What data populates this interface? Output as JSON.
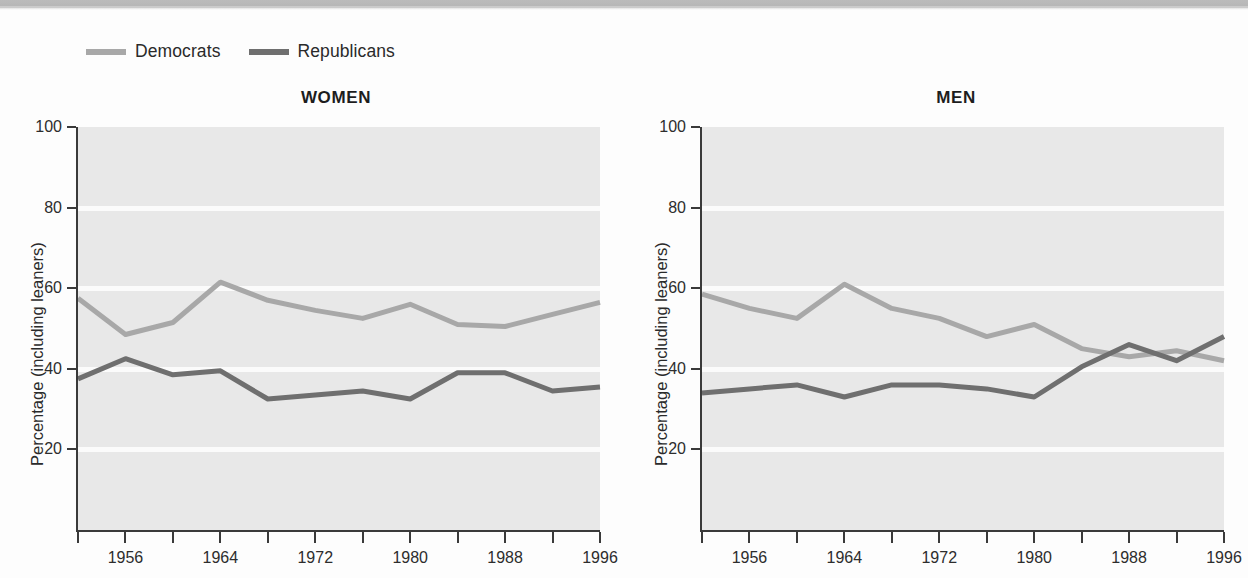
{
  "legend": {
    "entries": [
      {
        "label": "Democrats",
        "color": "#a8a8a8",
        "icon": "line-swatch-icon"
      },
      {
        "label": "Republicans",
        "color": "#6f6f6f",
        "icon": "line-swatch-icon"
      }
    ]
  },
  "panels": {
    "women": {
      "title": "WOMEN"
    },
    "men": {
      "title": "MEN"
    }
  },
  "axis": {
    "ylabel": "Percentage (including leaners)",
    "yticks": [
      "20",
      "40",
      "60",
      "80",
      "100"
    ],
    "xticks_labeled": [
      "1956",
      "1964",
      "1972",
      "1980",
      "1988",
      "1996"
    ]
  },
  "chart_data": [
    {
      "type": "line",
      "title": "WOMEN",
      "xlabel": "",
      "ylabel": "Percentage (including leaners)",
      "xlim": [
        1952,
        1996
      ],
      "ylim": [
        0,
        100
      ],
      "ytick_values": [
        20,
        40,
        60,
        80,
        100
      ],
      "grid": true,
      "legend_position": "above-top-left",
      "x": [
        1952,
        1956,
        1960,
        1964,
        1968,
        1972,
        1976,
        1980,
        1984,
        1988,
        1992,
        1996
      ],
      "series": [
        {
          "name": "Democrats",
          "color": "#a8a8a8",
          "values": [
            57.5,
            48.5,
            51.5,
            61.5,
            57,
            54.5,
            52.5,
            56,
            51,
            50.5,
            53.5,
            56.5
          ]
        },
        {
          "name": "Republicans",
          "color": "#6f6f6f",
          "values": [
            37.5,
            42.5,
            38.5,
            39.5,
            32.5,
            33.5,
            34.5,
            32.5,
            39,
            39,
            34.5,
            35.5
          ]
        }
      ]
    },
    {
      "type": "line",
      "title": "MEN",
      "xlabel": "",
      "ylabel": "Percentage (including leaners)",
      "xlim": [
        1952,
        1996
      ],
      "ylim": [
        0,
        100
      ],
      "ytick_values": [
        20,
        40,
        60,
        80,
        100
      ],
      "grid": true,
      "legend_position": "above-top-left",
      "x": [
        1952,
        1956,
        1960,
        1964,
        1968,
        1972,
        1976,
        1980,
        1984,
        1988,
        1992,
        1996
      ],
      "series": [
        {
          "name": "Democrats",
          "color": "#a8a8a8",
          "values": [
            58.5,
            55,
            52.5,
            61,
            55,
            52.5,
            48,
            51,
            45,
            43,
            44.5,
            42
          ]
        },
        {
          "name": "Republicans",
          "color": "#6f6f6f",
          "values": [
            34,
            35,
            36,
            33,
            36,
            36,
            35,
            33,
            40.5,
            46,
            42,
            48
          ]
        }
      ]
    }
  ]
}
